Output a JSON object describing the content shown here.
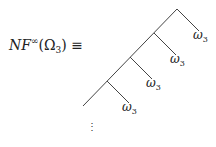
{
  "lhs": {
    "base": "NF",
    "sup": "∞",
    "open": "(",
    "arg": "Ω",
    "arg_sub": "3",
    "close": ")",
    "relation": " ≡"
  },
  "tree": {
    "leaf_symbol": "ω",
    "leaf_sub": "3",
    "leaves": [
      {
        "label": "ω",
        "sub": "3"
      },
      {
        "label": "ω",
        "sub": "3"
      },
      {
        "label": "ω",
        "sub": "3"
      },
      {
        "label": "ω",
        "sub": "3"
      }
    ],
    "continuation": "⋮",
    "line_color": "#444444"
  }
}
